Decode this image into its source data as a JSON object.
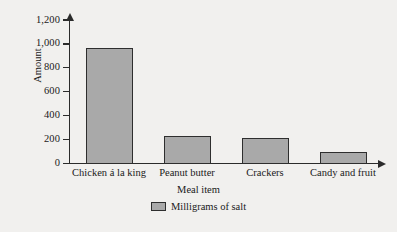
{
  "chart_data": {
    "type": "bar",
    "title": "",
    "subtitle": "",
    "categories": [
      "Chicken á la king",
      "Peanut butter",
      "Crackers",
      "Candy and fruit"
    ],
    "values": [
      970,
      230,
      210,
      100
    ],
    "series": [
      {
        "name": "Milligrams of salt",
        "values": [
          970,
          230,
          210,
          100
        ],
        "color": "#a9a9a9"
      }
    ],
    "xlabel": "Meal item",
    "ylabel": "Amount",
    "ylim": [
      0,
      1200
    ],
    "yticks": [
      0,
      200,
      400,
      600,
      800,
      1000,
      1200
    ],
    "ytick_labels": [
      "0",
      "200",
      "400",
      "600",
      "800",
      "1,000",
      "1,200"
    ],
    "grid": false,
    "legend": {
      "position": "bottom-center",
      "entries": [
        {
          "label": "Milligrams of salt",
          "color": "#a9a9a9"
        }
      ]
    },
    "axis_arrows": {
      "y_top": true,
      "x_right": true
    },
    "colors": {
      "bar_fill": "#a9a9a9",
      "bar_stroke": "#2e2e2e",
      "axis": "#2b2b2b",
      "background": "#f1f0ee",
      "text": "#1a1a1a"
    }
  }
}
